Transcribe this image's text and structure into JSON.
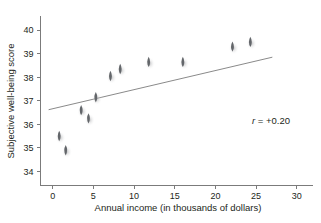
{
  "chart_data": {
    "type": "scatter",
    "title": "",
    "xlabel": "Annual income (in thousands of dollars)",
    "ylabel": "Subjective well-being score",
    "xlim": [
      -1.5,
      32
    ],
    "ylim": [
      33.4,
      40.6
    ],
    "xticks": [
      0,
      5,
      10,
      15,
      20,
      25,
      30
    ],
    "xtick_labels": [
      "0",
      "5",
      "10",
      "15",
      "20",
      "25",
      "30"
    ],
    "yticks": [
      34,
      35,
      36,
      37,
      38,
      39,
      40
    ],
    "ytick_labels": [
      "34",
      "35",
      "36",
      "37",
      "38",
      "39",
      "40"
    ],
    "grid": false,
    "legend": null,
    "points": [
      {
        "x": 0.8,
        "y": 35.5
      },
      {
        "x": 1.6,
        "y": 34.9
      },
      {
        "x": 3.5,
        "y": 36.6
      },
      {
        "x": 4.4,
        "y": 36.25
      },
      {
        "x": 5.3,
        "y": 37.15
      },
      {
        "x": 7.1,
        "y": 38.05
      },
      {
        "x": 8.3,
        "y": 38.35
      },
      {
        "x": 11.8,
        "y": 38.65
      },
      {
        "x": 16.0,
        "y": 38.65
      },
      {
        "x": 22.1,
        "y": 39.3
      },
      {
        "x": 24.3,
        "y": 39.5
      }
    ],
    "trend_line": {
      "x_start": -0.5,
      "y_start": 36.62,
      "x_end": 27.0,
      "y_end": 38.85
    },
    "annotations": [
      {
        "name": "correlation-annotation",
        "symbol": "r",
        "equals": " = +0.20",
        "full_text": "r = +0.20",
        "x": 21.0,
        "y": 36.4
      }
    ]
  },
  "axis": {
    "x_title": "Annual income (in thousands of dollars)",
    "y_title": "Subjective well-being score"
  }
}
